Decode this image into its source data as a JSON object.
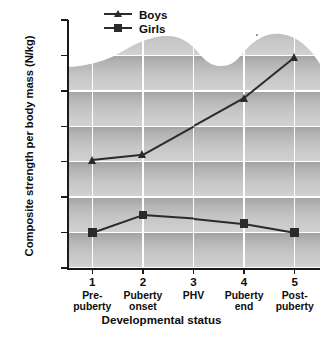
{
  "chart_data": {
    "type": "line",
    "title": "",
    "xlabel": "Developmental status",
    "ylabel": "Composite strength per body mass (N/kg)",
    "categories": [
      "1",
      "2",
      "3",
      "4",
      "5"
    ],
    "category_names": [
      "Pre-\npuberty",
      "Puberty\nonset",
      "PHV",
      "Puberty\nend",
      "Post-\npuberty"
    ],
    "xtick_numbers": [
      "1",
      "2",
      "3",
      "4",
      "5"
    ],
    "xtick_names_line1": [
      "Pre-",
      "Puberty",
      "PHV",
      "Puberty",
      "Post-"
    ],
    "xtick_names_line2": [
      "puberty",
      "onset",
      "",
      "end",
      "puberty"
    ],
    "ylim": [
      18,
      32
    ],
    "yticks": [
      18,
      20,
      22,
      24,
      26,
      28,
      30,
      32
    ],
    "ytick_labels": [
      "18",
      "20",
      "22",
      "24",
      "26",
      "28",
      "30",
      "32"
    ],
    "grid": "horizontal-and-vertical-white-on-gray-bands",
    "legend_position": "top-center",
    "series": [
      {
        "name": "Boys",
        "marker": "triangle",
        "color": "#2b2b2b",
        "values": [
          24.1,
          24.4,
          26.0,
          27.6,
          29.9
        ]
      },
      {
        "name": "Girls",
        "marker": "square",
        "color": "#2b2b2b",
        "values": [
          20.0,
          21.0,
          20.8,
          20.5,
          20.0
        ]
      }
    ]
  },
  "legend": {
    "entries": [
      {
        "label": "Boys",
        "marker": "triangle"
      },
      {
        "label": "Girls",
        "marker": "square"
      }
    ]
  },
  "axes": {
    "y_title": "Composite strength per body mass (N/kg)",
    "x_title": "Developmental status"
  },
  "colors": {
    "ink": "#0d0d0d",
    "line": "#2b2b2b",
    "grid": "#ffffff",
    "band_dark": "#a2a2a2",
    "band_light": "#d2d2d2",
    "page": "#ffffff"
  }
}
